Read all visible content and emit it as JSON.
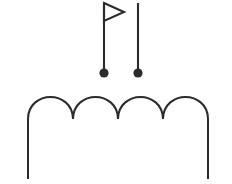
{
  "figure": {
    "background_color": "#ffffff",
    "stroke_color": "#2b2b2b",
    "fill_color": "#2b2b2b",
    "canvas": {
      "width": 232,
      "height": 184
    }
  },
  "elements": {
    "flag_pole": {
      "label": "flag-pole",
      "stroke_width": 2.1,
      "x": 104,
      "y_top": 3,
      "y_bottom": 73
    },
    "flag_banner": {
      "label": "flag-banner",
      "shape": "triangle-outline-right",
      "stroke_width": 2.1,
      "points": "104,3 124,12 104,21"
    },
    "flag_base_dot": {
      "label": "flag-base-dot",
      "shape": "filled-circle",
      "cx": 104,
      "cy": 73,
      "r": 4.6
    },
    "plain_pin": {
      "label": "plain-pin-pole",
      "stroke_width": 2.1,
      "x": 138,
      "y_top": 3,
      "y_bottom": 73
    },
    "plain_pin_dot": {
      "label": "plain-pin-base-dot",
      "shape": "filled-circle",
      "cx": 138,
      "cy": 73,
      "r": 4.6
    },
    "scalloped_arch": {
      "label": "scalloped-arch",
      "stroke_width": 2.0,
      "arch_count": 4,
      "peak_y": 97,
      "valley_y": 119,
      "left_stem_x": 28,
      "right_stem_x": 208,
      "stem_bottom_y": 179,
      "valley_x_positions": [
        73,
        118,
        163
      ],
      "path": "M 28,179 L 28,119 C 28,104 40,97 50.5,97 C 61,97 73,104 73,119 C 73,104 85,97 95.5,97 C 106,97 118,104 118,119 C 118,104 130,97 140.5,97 C 151,97 163,104 163,119 C 163,104 175,97 185.5,97 C 196,97 208,104 208,119 L 208,179"
    }
  }
}
